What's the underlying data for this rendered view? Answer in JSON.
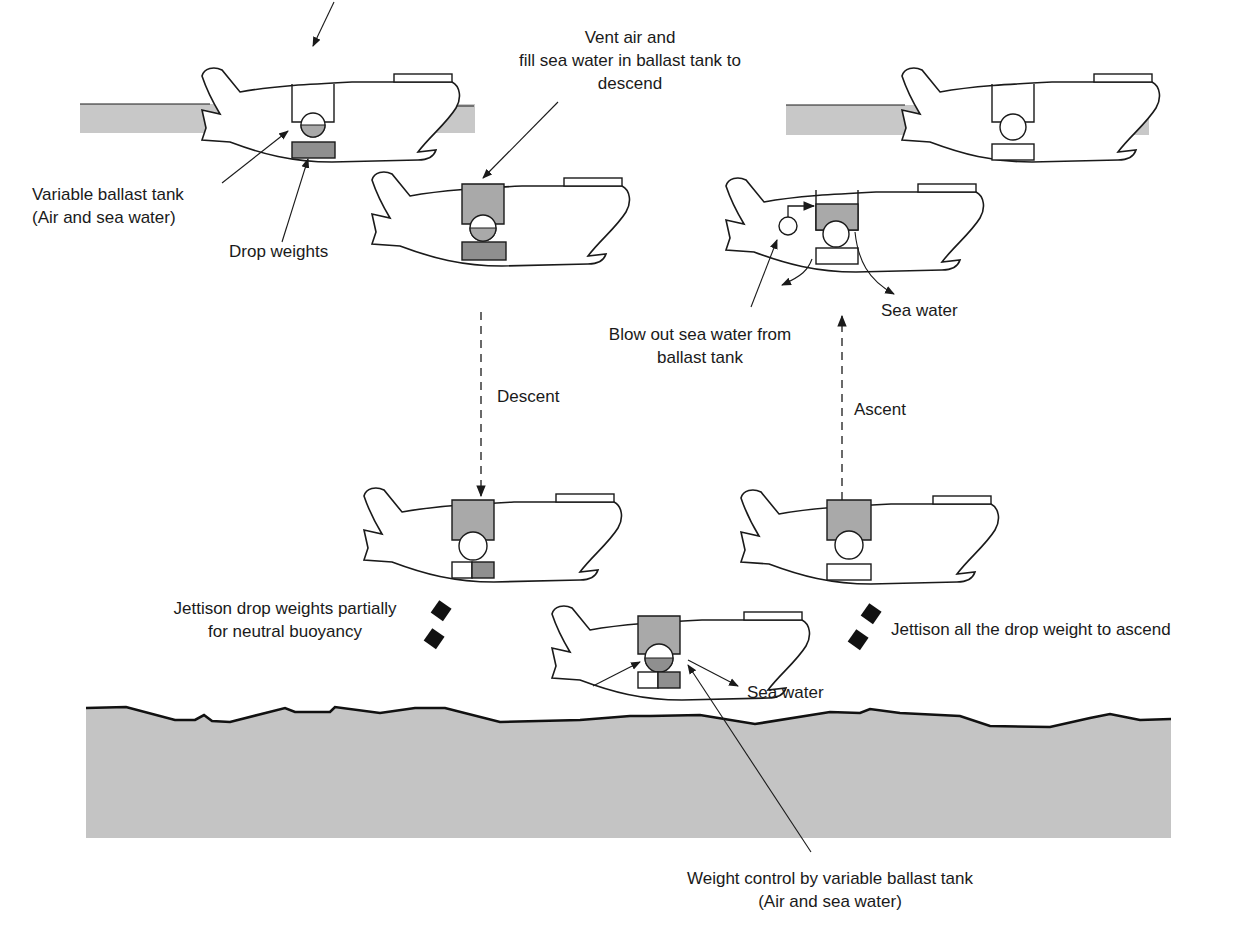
{
  "colors": {
    "water_band": "#c8c8c8",
    "seabed": "#c4c4c4",
    "tank_fill": "#a9a9a9",
    "weight_fill": "#8f8f8f",
    "dropped_weight": "#111111",
    "outline": "#1a1a1a"
  },
  "labels": {
    "vent_air": [
      "Vent air and",
      "fill sea water in ballast tank to",
      "descend"
    ],
    "variable_ballast_tank": [
      "Variable ballast tank",
      "(Air and sea water)"
    ],
    "drop_weights": "Drop weights",
    "descent": "Descent",
    "ascent": "Ascent",
    "blow_out": [
      "Blow out sea water from",
      "ballast tank"
    ],
    "sea_water_top": "Sea water",
    "jettison_partial": [
      "Jettison drop weights partially",
      "for neutral buoyancy"
    ],
    "jettison_all": "Jettison all the drop weight to ascend",
    "sea_water_bottom": "Sea water",
    "weight_control": [
      "Weight control by variable ballast tank",
      "(Air and sea water)"
    ]
  },
  "stages": [
    {
      "name": "surface-start",
      "tank": "empty",
      "sphere": "half-water",
      "weights": "full"
    },
    {
      "name": "diving",
      "tank": "water",
      "sphere": "half-water",
      "weights": "full"
    },
    {
      "name": "descending-neutral",
      "tank": "water",
      "sphere": "air",
      "weights": "partial"
    },
    {
      "name": "seafloor-hover",
      "tank": "water",
      "sphere": "half-water",
      "weights": "partial"
    },
    {
      "name": "ascending",
      "tank": "water",
      "sphere": "air",
      "weights": "none"
    },
    {
      "name": "blow-out",
      "tank": "partial",
      "sphere": "air",
      "weights": "none"
    },
    {
      "name": "surface-end",
      "tank": "empty",
      "sphere": "air",
      "weights": "none"
    }
  ]
}
